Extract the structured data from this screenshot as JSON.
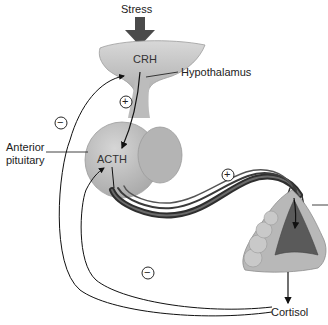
{
  "diagram": {
    "labels": {
      "stress": "Stress",
      "crh": "CRH",
      "hypothalamus": "Hypothalamus",
      "anterior_pituitary_line1": "Anterior",
      "anterior_pituitary_line2": "pituitary",
      "acth": "ACTH",
      "cortisol": "Cortisol"
    },
    "signs": {
      "plus": "+",
      "minus": "−"
    },
    "colors": {
      "gland": "#c4c4c4",
      "gland_dark": "#a9a9a9",
      "adrenal_medulla": "#5a5a5a",
      "vessel": "#3a3a3a",
      "arrow": "#444444",
      "line": "#111111"
    }
  }
}
